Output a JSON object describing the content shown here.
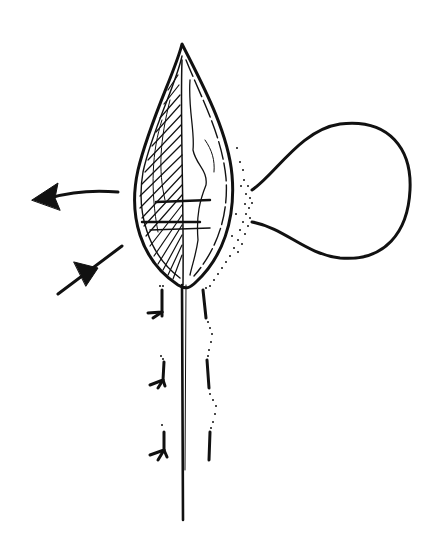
{
  "figure": {
    "colors": {
      "ink": "#111111",
      "background": "#ffffff"
    },
    "elements": {
      "blade": "leaf-blade",
      "balloon": "balloon-sac",
      "arrow_out": "outflow-arrow",
      "arrow_in": "inflow-arrow",
      "stalk": "stalk",
      "appendages": [
        "branch-appendage-1",
        "branch-appendage-2",
        "branch-appendage-3"
      ],
      "stipple": "stippled-particles"
    }
  }
}
